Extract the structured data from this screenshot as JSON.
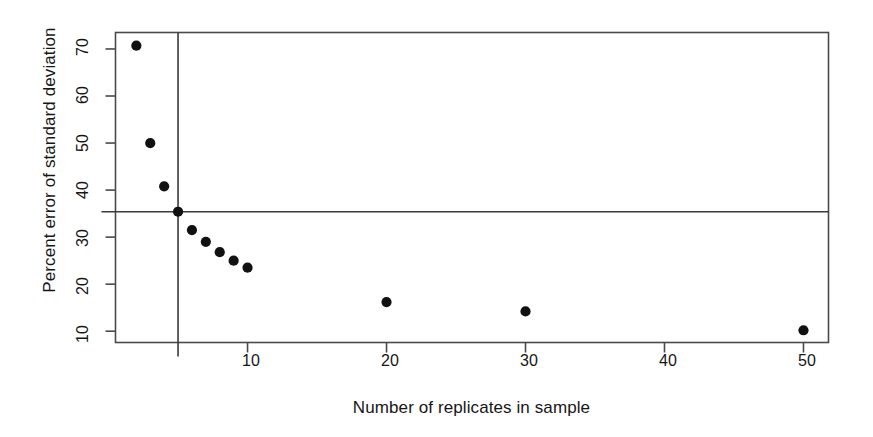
{
  "chart_data": {
    "type": "scatter",
    "title": "",
    "xlabel": "Number of replicates in sample",
    "ylabel": "Percent error of standard deviation",
    "x": [
      2,
      3,
      4,
      5,
      6,
      7,
      8,
      9,
      10,
      20,
      30,
      50
    ],
    "values": [
      70.7,
      50.0,
      40.8,
      35.4,
      31.5,
      29.0,
      26.8,
      25.0,
      23.5,
      16.2,
      14.2,
      10.2
    ],
    "points": [
      {
        "x": 2,
        "y": 70.7
      },
      {
        "x": 3,
        "y": 50.0
      },
      {
        "x": 4,
        "y": 40.8
      },
      {
        "x": 5,
        "y": 35.4
      },
      {
        "x": 6,
        "y": 31.5
      },
      {
        "x": 7,
        "y": 29.0
      },
      {
        "x": 8,
        "y": 26.8
      },
      {
        "x": 9,
        "y": 25.0
      },
      {
        "x": 10,
        "y": 23.5
      },
      {
        "x": 20,
        "y": 16.2
      },
      {
        "x": 30,
        "y": 14.2
      },
      {
        "x": 50,
        "y": 10.2
      }
    ],
    "xtick_labels": [
      "10",
      "20",
      "30",
      "40",
      "50"
    ],
    "xticks": [
      10,
      20,
      30,
      40,
      50
    ],
    "ytick_labels": [
      "10",
      "20",
      "30",
      "40",
      "50",
      "60",
      "70"
    ],
    "yticks": [
      10,
      20,
      30,
      40,
      50,
      60,
      70
    ],
    "xlim": [
      0.5,
      51.8
    ],
    "ylim": [
      7.6,
      73.5
    ],
    "grid": false,
    "legend": null,
    "annotations": [
      {
        "kind": "vertical-reference-line",
        "x": 5,
        "label": ""
      },
      {
        "kind": "horizontal-reference-line",
        "y": 35.4,
        "label": ""
      }
    ],
    "marker_color": "#111111",
    "line_color": "#3a3a3a",
    "frame_color": "#4a4a4a",
    "background": "#ffffff"
  }
}
